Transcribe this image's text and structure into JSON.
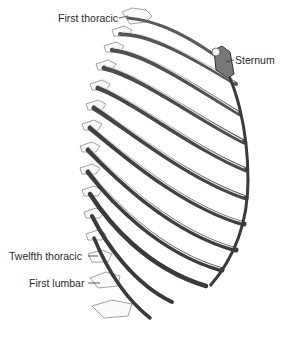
{
  "figure": {
    "labels": {
      "first_thoracic": "First thoracic",
      "sternum": "Sternum",
      "twelfth_thoracic": "Twelfth thoracic",
      "first_lumbar": "First lumbar"
    },
    "colors": {
      "background": "#ffffff",
      "bone_outline": "#3a3a3a",
      "bone_shade": "#6a6a6a",
      "label_text": "#2a2a2a"
    }
  }
}
